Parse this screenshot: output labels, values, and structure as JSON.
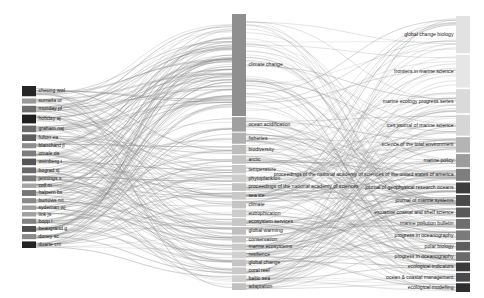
{
  "figure": {
    "type": "sankey",
    "title": "",
    "width": 484,
    "height": 298,
    "background": "#ffffff",
    "link_color": "#8c8c8c",
    "label_color": "#1a1a1a"
  },
  "chart_data": {
    "type": "sankey",
    "title": "",
    "xlabel": "",
    "ylabel": "",
    "columns": [
      {
        "name": "authors",
        "x": 22,
        "width": 14
      },
      {
        "name": "keywords",
        "x": 232,
        "width": 14
      },
      {
        "name": "journals",
        "x": 456,
        "width": 14
      }
    ],
    "nodes": {
      "authors": [
        {
          "label": "cheung wwl",
          "value": 14,
          "color": "#262626"
        },
        {
          "label": "sumaila ur",
          "value": 7,
          "color": "#9a9a9a"
        },
        {
          "label": "munday pl",
          "value": 9,
          "color": "#6e6e6e"
        },
        {
          "label": "hobday aj",
          "value": 12,
          "color": "#1f1f1f"
        },
        {
          "label": "graham naj",
          "value": 9,
          "color": "#6a6a6a"
        },
        {
          "label": "fulton ea",
          "value": 9,
          "color": "#5e5e5e"
        },
        {
          "label": "blanchard jl",
          "value": 7,
          "color": "#8e8e8e"
        },
        {
          "label": "omale da",
          "value": 8,
          "color": "#7c7c7c"
        },
        {
          "label": "weinberg t",
          "value": 9,
          "color": "#565656"
        },
        {
          "label": "bograd sj",
          "value": 8,
          "color": "#6a6a6a"
        },
        {
          "label": "jennings s",
          "value": 8,
          "color": "#7a7a7a"
        },
        {
          "label": "coll m",
          "value": 6,
          "color": "#a5a5a5"
        },
        {
          "label": "halpern bs",
          "value": 8,
          "color": "#767676"
        },
        {
          "label": "burrows mt",
          "value": 7,
          "color": "#8a8a8a"
        },
        {
          "label": "sydeman wj",
          "value": 6,
          "color": "#9e9e9e"
        },
        {
          "label": "link js",
          "value": 6,
          "color": "#a0a0a0"
        },
        {
          "label": "bopp l",
          "value": 7,
          "color": "#828282"
        },
        {
          "label": "beaugrand g",
          "value": 8,
          "color": "#4e4e4e"
        },
        {
          "label": "doney sc",
          "value": 7,
          "color": "#8a8a8a"
        },
        {
          "label": "duarte cm",
          "value": 9,
          "color": "#242424"
        }
      ],
      "keywords": [
        {
          "label": "climate change",
          "value": 120,
          "color": "#8f8f8f"
        },
        {
          "label": "ocean acidification",
          "value": 17,
          "color": "#a0a0a0"
        },
        {
          "label": "fisheries",
          "value": 13,
          "color": "#b0b0b0"
        },
        {
          "label": "biodiversity",
          "value": 11,
          "color": "#bdbdbd"
        },
        {
          "label": "arctic",
          "value": 10,
          "color": "#c3c3c3"
        },
        {
          "label": "temperature",
          "value": 10,
          "color": "#c8c8c8"
        },
        {
          "label": "phytoplankton",
          "value": 9,
          "color": "#cccccc"
        },
        {
          "label": "proceedings of the national academy of sciences",
          "value": 9,
          "color": "#c2c2c2"
        },
        {
          "label": "sea ice",
          "value": 9,
          "color": "#c9c9c9"
        },
        {
          "label": "climate",
          "value": 9,
          "color": "#c5c5c5"
        },
        {
          "label": "eutrophication",
          "value": 9,
          "color": "#cdcdcd"
        },
        {
          "label": "ecosystem services",
          "value": 9,
          "color": "#c7c7c7"
        },
        {
          "label": "global warming",
          "value": 9,
          "color": "#bfbfbf"
        },
        {
          "label": "conservation",
          "value": 8,
          "color": "#c6c6c6"
        },
        {
          "label": "marine ecosystems",
          "value": 8,
          "color": "#cacaca"
        },
        {
          "label": "resilience",
          "value": 8,
          "color": "#d0d0d0"
        },
        {
          "label": "global change",
          "value": 8,
          "color": "#c4c4c4"
        },
        {
          "label": "coral reef",
          "value": 8,
          "color": "#c9c9c9"
        },
        {
          "label": "baltic sea",
          "value": 8,
          "color": "#cfcfcf"
        },
        {
          "label": "adaptation",
          "value": 8,
          "color": "#c1c1c1"
        }
      ],
      "journals": [
        {
          "label": "global change biology",
          "value": 34,
          "color": "#e2e2e2"
        },
        {
          "label": "frontiers in marine science",
          "value": 30,
          "color": "#e6e6e6"
        },
        {
          "label": "marine ecology progress series",
          "value": 22,
          "color": "#dadada"
        },
        {
          "label": "ices journal of marine science",
          "value": 19,
          "color": "#d6d6d6"
        },
        {
          "label": "science of the total environment",
          "value": 14,
          "color": "#b4b4b4"
        },
        {
          "label": "marine policy",
          "value": 12,
          "color": "#9c9c9c"
        },
        {
          "label": "proceedings of the national academy of sciences of the united states of america",
          "value": 11,
          "color": "#7e7e7e"
        },
        {
          "label": "journal of geophysical research oceans",
          "value": 10,
          "color": "#3d3d3d"
        },
        {
          "label": "journal of marine systems",
          "value": 10,
          "color": "#4a4a4a"
        },
        {
          "label": "estuarine coastal and shelf science",
          "value": 9,
          "color": "#5a5a5a"
        },
        {
          "label": "marine pollution bulletin",
          "value": 9,
          "color": "#6e6e6e"
        },
        {
          "label": "progress in oceanography",
          "value": 9,
          "color": "#7a7a7a"
        },
        {
          "label": "polar biology",
          "value": 8,
          "color": "#5e5e5e"
        },
        {
          "label": "progress in oceanography",
          "value": 8,
          "color": "#6a6a6a"
        },
        {
          "label": "ecological indicators",
          "value": 8,
          "color": "#3a3a3a"
        },
        {
          "label": "ocean & coastal management",
          "value": 8,
          "color": "#4a4a4a"
        },
        {
          "label": "ecological modelling",
          "value": 8,
          "color": "#2e2e2e"
        }
      ]
    },
    "legend": {
      "show": false
    },
    "grid": false
  }
}
